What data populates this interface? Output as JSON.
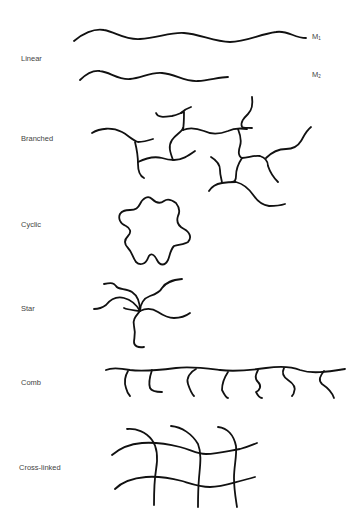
{
  "diagram": {
    "rows": [
      {
        "id": "linear",
        "label": "Linear",
        "chains": [
          {
            "label_main": "M",
            "label_sub": "1"
          },
          {
            "label_main": "M",
            "label_sub": "2"
          }
        ]
      },
      {
        "id": "branched",
        "label": "Branched"
      },
      {
        "id": "cyclic",
        "label": "Cyclic"
      },
      {
        "id": "star",
        "label": "Star",
        "arms": 6
      },
      {
        "id": "comb",
        "label": "Comb",
        "teeth": 7
      },
      {
        "id": "cross-linked",
        "label": "Cross-linked",
        "horizontal_chains": 2,
        "vertical_chains": 3
      }
    ]
  }
}
